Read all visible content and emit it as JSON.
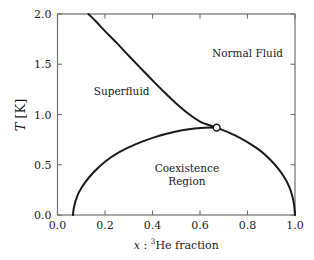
{
  "figure": {
    "background": "#ffffff",
    "frame_color": "#6e6e6e",
    "curve_color": "#1a1a1a",
    "text_color": "#1a1a1a",
    "marker_face": "#ffffff"
  },
  "axes": {
    "x": {
      "label_prefix": "x",
      "label_separator": " : ",
      "label_sup": "3",
      "label_suffix": "He fraction",
      "ticks": [
        "0.0",
        "0.2",
        "0.4",
        "0.6",
        "0.8",
        "1.0"
      ],
      "tick_values": [
        0.0,
        0.2,
        0.4,
        0.6,
        0.8,
        1.0
      ],
      "min": 0.0,
      "max": 1.0
    },
    "y": {
      "label_symbol": "T",
      "label_units": " [K]",
      "ticks": [
        "0.0",
        "0.5",
        "1.0",
        "1.5",
        "2.0"
      ],
      "tick_values": [
        0.0,
        0.5,
        1.0,
        1.5,
        2.0
      ],
      "min": 0.0,
      "max": 2.0
    }
  },
  "regions": [
    {
      "name": "superfluid",
      "lines": [
        "Superfluid"
      ],
      "x": 0.27,
      "y": 1.22
    },
    {
      "name": "normal-fluid",
      "lines": [
        "Normal Fluid"
      ],
      "x": 0.8,
      "y": 1.6
    },
    {
      "name": "coexistence",
      "lines": [
        "Coexistence",
        "Region"
      ],
      "x": 0.545,
      "y": 0.4
    }
  ],
  "chart_data": {
    "type": "line",
    "title": "",
    "xlabel": "x : 3He fraction",
    "ylabel": "T [K]",
    "xlim": [
      0.0,
      1.0
    ],
    "ylim": [
      0.0,
      2.0
    ],
    "grid": false,
    "legend": "none",
    "series": [
      {
        "name": "lambda-line",
        "description": "Superfluid transition (lambda) line separating Superfluid from Normal Fluid",
        "x": [
          0.13,
          0.16,
          0.2,
          0.25,
          0.3,
          0.35,
          0.4,
          0.45,
          0.5,
          0.55,
          0.6,
          0.64,
          0.67
        ],
        "y": [
          2.0,
          1.93,
          1.83,
          1.71,
          1.585,
          1.462,
          1.34,
          1.222,
          1.11,
          1.01,
          0.93,
          0.893,
          0.87
        ]
      },
      {
        "name": "coexistence-left-branch",
        "description": "Helium-4 rich (superfluid) side of the phase separation curve",
        "x": [
          0.065,
          0.068,
          0.075,
          0.09,
          0.115,
          0.15,
          0.2,
          0.26,
          0.33,
          0.41,
          0.49,
          0.56,
          0.62,
          0.67
        ],
        "y": [
          0.0,
          0.06,
          0.13,
          0.225,
          0.32,
          0.42,
          0.53,
          0.625,
          0.705,
          0.775,
          0.825,
          0.855,
          0.868,
          0.87
        ]
      },
      {
        "name": "coexistence-right-branch",
        "description": "Helium-3 rich (normal fluid) side of the phase separation curve",
        "x": [
          0.67,
          0.72,
          0.77,
          0.82,
          0.86,
          0.9,
          0.93,
          0.955,
          0.975,
          0.988,
          0.996,
          1.0
        ],
        "y": [
          0.87,
          0.822,
          0.765,
          0.695,
          0.628,
          0.54,
          0.46,
          0.375,
          0.285,
          0.195,
          0.105,
          0.0
        ]
      }
    ],
    "points": [
      {
        "name": "tricritical-point",
        "x": 0.67,
        "y": 0.87,
        "marker": "open-circle"
      }
    ]
  }
}
